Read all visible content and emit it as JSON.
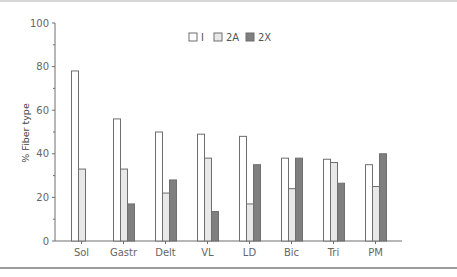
{
  "chart_data": {
    "type": "bar",
    "title": "",
    "xlabel": "",
    "ylabel": "% Fiber type",
    "ylim": [
      0,
      100
    ],
    "yticks": [
      0,
      20,
      40,
      60,
      80,
      100
    ],
    "grid": false,
    "legend_position": "top-center",
    "categories": [
      "Sol",
      "Gastr",
      "Delt",
      "VL",
      "LD",
      "Bic",
      "Tri",
      "PM"
    ],
    "series": [
      {
        "name": "I",
        "color": "#ffffff",
        "values": [
          78,
          56,
          50,
          49,
          48,
          38,
          37.5,
          35
        ]
      },
      {
        "name": "2A",
        "color": "#e8e8e8",
        "values": [
          33,
          33,
          22,
          38,
          17,
          24,
          36,
          25
        ]
      },
      {
        "name": "2X",
        "color": "#7f7f7f",
        "values": [
          0,
          17,
          28,
          13.5,
          35,
          38,
          26.5,
          40
        ]
      }
    ]
  }
}
